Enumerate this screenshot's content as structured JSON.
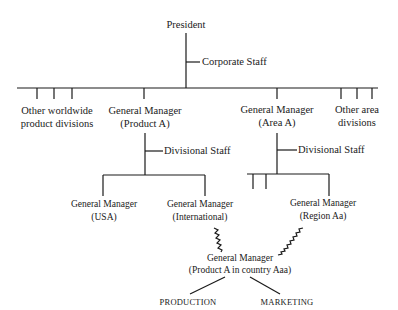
{
  "diagram": {
    "type": "organization-chart",
    "nodes": {
      "president": "President",
      "corporate_staff": "Corporate Staff",
      "other_product_line1": "Other worldwide",
      "other_product_line2": "product divisions",
      "gm_product_a_line1": "General Manager",
      "gm_product_a_line2": "(Product A)",
      "gm_area_a_line1": "General Manager",
      "gm_area_a_line2": "(Area A)",
      "other_area_line1": "Other area",
      "other_area_line2": "divisions",
      "divisional_staff_product": "Divisional Staff",
      "divisional_staff_area": "Divisional Staff",
      "gm_usa_line1": "General Manager",
      "gm_usa_line2": "(USA)",
      "gm_intl_line1": "General Manager",
      "gm_intl_line2": "(International)",
      "gm_region_line1": "General Manager",
      "gm_region_line2": "(Region Aa)",
      "gm_country_line1": "General Manager",
      "gm_country_line2": "(Product A in country Aaa)",
      "production": "PRODUCTION",
      "marketing": "MARKETING"
    },
    "line_color": "#1a1a1a"
  }
}
